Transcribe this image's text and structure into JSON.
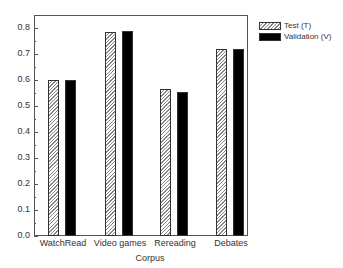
{
  "chart_data": {
    "type": "bar",
    "title": "",
    "xlabel": "Corpus",
    "ylabel": "",
    "ylim": [
      0,
      0.85
    ],
    "yticks": [
      "0.0",
      "0.1",
      "0.2",
      "0.3",
      "0.4",
      "0.5",
      "0.6",
      "0.7",
      "0.8"
    ],
    "categories": [
      "WatchRead",
      "Video games",
      "Rereading",
      "Debates"
    ],
    "series": [
      {
        "name": "Test (T)",
        "values": [
          0.6,
          0.785,
          0.565,
          0.72
        ],
        "pattern": "hatched"
      },
      {
        "name": "Validation (V)",
        "values": [
          0.6,
          0.79,
          0.555,
          0.72
        ],
        "color": "#000000"
      }
    ],
    "legend_position": "right-top",
    "grid": false
  }
}
